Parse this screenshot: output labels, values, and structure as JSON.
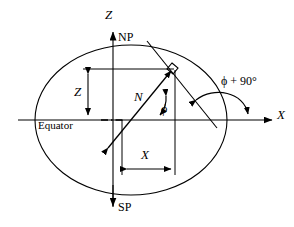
{
  "figure": {
    "type": "geometric-diagram",
    "background_color": "#ffffff",
    "line_color": "#000000",
    "labels": {
      "z_axis": "Z",
      "north_pole": "NP",
      "south_pole": "SP",
      "x_axis": "X",
      "z_dimension": "Z",
      "x_dimension": "X",
      "normal": "N",
      "latitude_angle": "ϕ",
      "tangent_angle": "ϕ + 90°",
      "equator": "Equator"
    },
    "elements": {
      "ellipse": {
        "center_x": 131,
        "center_y": 120,
        "radius_x": 96,
        "radius_y": 75
      },
      "point_on_ellipse": {
        "x": 172,
        "y": 68
      },
      "right_angle_marker": true,
      "axes": {
        "horizontal_span": [
          18,
          276
        ],
        "vertical_span": [
          37,
          210
        ]
      },
      "dimension_lines": {
        "z": {
          "x": 88,
          "y_top": 69,
          "y_bottom": 119
        },
        "x": {
          "y": 169,
          "x_left": 122,
          "x_right": 175
        }
      },
      "normal_line": {
        "from_x": 107,
        "from_y": 146,
        "to_x": 172,
        "to_y": 68
      },
      "tangent_line": {
        "from_x": 147,
        "from_y": 41,
        "to_x": 216,
        "to_y": 127
      }
    }
  }
}
